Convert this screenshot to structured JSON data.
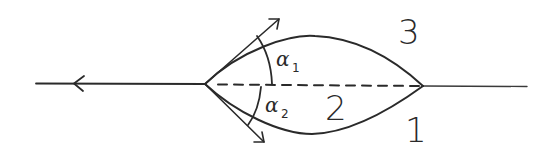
{
  "diagram": {
    "type": "hand-drawn lens / wave-refraction sketch",
    "colors": {
      "ink": "#2a2a2a",
      "background": "#ffffff"
    },
    "regions": [
      {
        "id": "region-1",
        "label": "1",
        "position": "below-right"
      },
      {
        "id": "region-2",
        "label": "2",
        "position": "inside-lens-bottom"
      },
      {
        "id": "region-3",
        "label": "3",
        "position": "above-right"
      }
    ],
    "angles": [
      {
        "id": "alpha-1",
        "symbol": "α",
        "subscript": "1",
        "position": "upper"
      },
      {
        "id": "alpha-2",
        "symbol": "α",
        "subscript": "2",
        "position": "lower"
      }
    ],
    "elements": {
      "axis_line": "solid horizontal line with left-pointing arrow",
      "chord": "dashed horizontal line between lens vertices",
      "upper_boundary": "curved arc between regions 2 and 3",
      "lower_boundary": "curved arc between regions 2 and 1",
      "upper_tangent_arrow": "arrow from left vertex, up-right",
      "lower_tangent_arrow": "arrow from left vertex, down-right"
    }
  }
}
